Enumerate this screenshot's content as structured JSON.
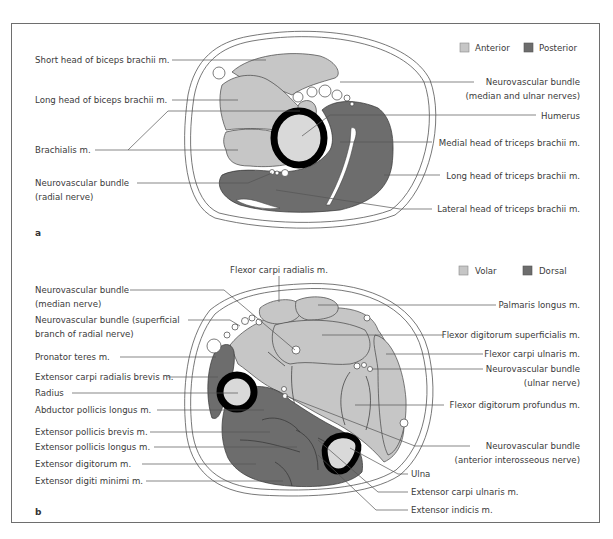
{
  "figure": {
    "panel_a": {
      "label": "a",
      "legend": [
        {
          "name": "Anterior",
          "color": "#c6c6c6"
        },
        {
          "name": "Posterior",
          "color": "#6d6d6d"
        }
      ],
      "left_labels": [
        "Short head of biceps brachii m.",
        "Long head of biceps brachii m.",
        "Brachialis m.",
        "Neurovascular bundle",
        "(radial nerve)"
      ],
      "right_labels": [
        "Neurovascular bundle",
        "(median and ulnar nerves)",
        "Humerus",
        "Medial head of triceps brachii m.",
        "Long head of triceps brachii m.",
        "Lateral head of triceps brachii m."
      ]
    },
    "panel_b": {
      "label": "b",
      "legend": [
        {
          "name": "Volar",
          "color": "#c6c6c6"
        },
        {
          "name": "Dorsal",
          "color": "#6d6d6d"
        }
      ],
      "top_label": "Flexor carpi radialis m.",
      "left_labels": [
        "Neurovascular bundle",
        "(median nerve)",
        "Neurovascular bundle (superficial",
        "branch of radial nerve)",
        "Pronator teres m.",
        "Extensor carpi radialis brevis m.",
        "Radius",
        "Abductor pollicis longus m.",
        "Extensor pollicis brevis m.",
        "Extensor pollicis longus m.",
        "Extensor digitorum m.",
        "Extensor digiti minimi m."
      ],
      "right_labels": [
        "Palmaris longus m.",
        "Flexor digitorum superficialis m.",
        "Flexor carpi ulnaris m.",
        "Neurovascular bundle",
        "(ulnar nerve)",
        "Flexor digitorum profundus m.",
        "Neurovascular bundle",
        "(anterior interosseous nerve)",
        "Ulna",
        "Extensor carpi ulnaris m.",
        "Extensor indicis m."
      ]
    }
  }
}
